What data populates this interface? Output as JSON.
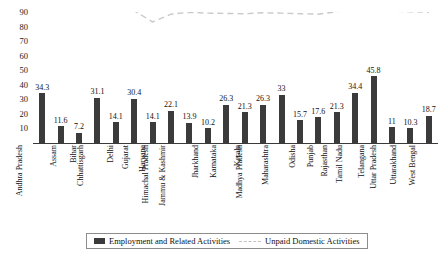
{
  "chart_data": {
    "type": "bar",
    "title": "",
    "subtitle": "",
    "xlabel": "",
    "ylabel": "",
    "ylim": [
      0,
      90
    ],
    "yticks": [
      10,
      20,
      30,
      40,
      50,
      60,
      70,
      80,
      90
    ],
    "grid": false,
    "legend_position": "bottom",
    "categories": [
      "Andhra Pradesh",
      "Assam",
      "Bihar",
      "Chhattisgarh",
      "Delhi",
      "Gujarat",
      "Haryana",
      "Himachal Pradesh",
      "Jammu & Kashmir",
      "Jharkhand",
      "Karnataka",
      "Kerala",
      "Madhya Pradesh",
      "Maharashtra",
      "Odisha",
      "Punjab",
      "Rajasthan",
      "Tamil Nadu",
      "Telangana",
      "Uttar Pradesh",
      "Uttarakhand",
      "West Bengal"
    ],
    "series": [
      {
        "name": "Employment and Related Activities",
        "plot_type": "bar",
        "color": "#3b3b3b",
        "values": [
          34.3,
          11.6,
          7.2,
          31.1,
          14.1,
          30.4,
          14.1,
          22.1,
          13.9,
          10.2,
          26.3,
          21.3,
          26.3,
          33,
          15.7,
          17.6,
          21.3,
          34.4,
          45.8,
          11,
          10.3,
          18.7
        ],
        "labels": [
          "34.3",
          "11.6",
          "7.2",
          "31.1",
          "14.1",
          "30.4",
          "14.1",
          "22.1",
          "13.9",
          "10.2",
          "26.3",
          "21.3",
          "26.3",
          "33",
          "15.7",
          "17.6",
          "21.3",
          "34.4",
          "45.8",
          "11",
          "10.3",
          "18.7"
        ]
      },
      {
        "name": "Unpaid Domestic Activities",
        "plot_type": "line",
        "style": "dashed",
        "color": "#c9c9c9",
        "values": [
          90.5,
          91.2,
          91.5,
          91.8,
          91.5,
          90.8,
          83.2,
          88.5,
          89.8,
          89.2,
          89.0,
          88.8,
          89.5,
          89.2,
          88.8,
          88.5,
          90.2,
          91.5,
          90.8,
          90.5,
          90.2,
          89.8
        ]
      }
    ]
  },
  "legend": {
    "items": [
      {
        "label": "Employment and Related Activities",
        "marker": "bar-swatch"
      },
      {
        "label": "Unpaid Domestic Activities",
        "marker": "dashed-line-swatch"
      }
    ]
  }
}
